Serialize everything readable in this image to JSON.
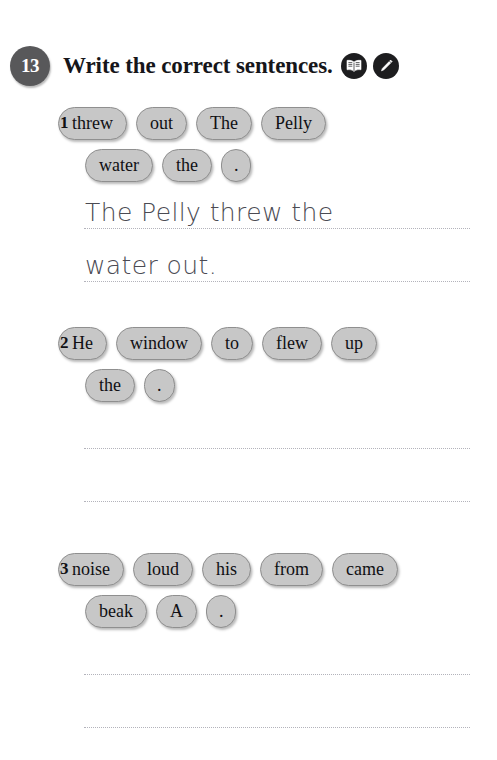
{
  "exercise": {
    "number": "13",
    "title": "Write the correct sentences.",
    "icons": [
      {
        "name": "open-book-icon",
        "label": "book"
      },
      {
        "name": "pencil-icon",
        "label": "pencil"
      }
    ]
  },
  "questions": [
    {
      "number": "1",
      "chip_rows": [
        [
          "threw",
          "out",
          "The",
          "Pelly"
        ],
        [
          "water",
          "the",
          "."
        ]
      ],
      "answer_lines": [
        "The Pelly threw the",
        "water out."
      ]
    },
    {
      "number": "2",
      "chip_rows": [
        [
          "He",
          "window",
          "to",
          "flew",
          "up"
        ],
        [
          "the",
          "."
        ]
      ],
      "answer_lines": [
        "",
        ""
      ]
    },
    {
      "number": "3",
      "chip_rows": [
        [
          "noise",
          "loud",
          "his",
          "from",
          "came"
        ],
        [
          "beak",
          "A",
          "."
        ]
      ],
      "answer_lines": [
        "",
        ""
      ]
    }
  ],
  "colors": {
    "chip_fill": "#c7c7c7",
    "chip_border": "#8f8f8f",
    "badge_fill": "#58585a",
    "icon_fill": "#1d1d1f",
    "handwriting": "#4b4b53",
    "rule_line": "#b3b3bb"
  }
}
